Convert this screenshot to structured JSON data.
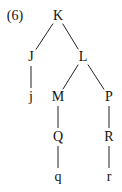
{
  "example_number": "(6)",
  "nodes": [
    {
      "id": "K",
      "label": "K",
      "x": 58,
      "y": 16
    },
    {
      "id": "J",
      "label": "J",
      "x": 31,
      "y": 57
    },
    {
      "id": "L",
      "label": "L",
      "x": 83,
      "y": 57
    },
    {
      "id": "j",
      "label": "j",
      "x": 31,
      "y": 97
    },
    {
      "id": "M",
      "label": "M",
      "x": 58,
      "y": 97
    },
    {
      "id": "P",
      "label": "P",
      "x": 109,
      "y": 97
    },
    {
      "id": "Q",
      "label": "Q",
      "x": 58,
      "y": 137
    },
    {
      "id": "R",
      "label": "R",
      "x": 109,
      "y": 137
    },
    {
      "id": "q",
      "label": "q",
      "x": 58,
      "y": 177
    },
    {
      "id": "r",
      "label": "r",
      "x": 109,
      "y": 177
    }
  ],
  "edges": [
    [
      "K",
      "J"
    ],
    [
      "K",
      "L"
    ],
    [
      "J",
      "j"
    ],
    [
      "L",
      "M"
    ],
    [
      "L",
      "P"
    ],
    [
      "M",
      "Q"
    ],
    [
      "Q",
      "q"
    ],
    [
      "P",
      "R"
    ],
    [
      "R",
      "r"
    ]
  ]
}
